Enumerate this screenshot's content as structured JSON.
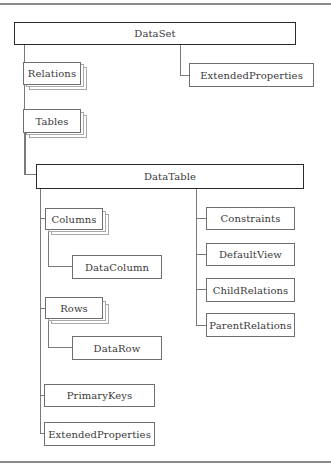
{
  "diagram": {
    "root": {
      "label": "DataSet"
    },
    "dataset_children": {
      "relations": {
        "label": "Relations",
        "collection": true
      },
      "tables": {
        "label": "Tables",
        "collection": true
      },
      "extended_properties": {
        "label": "ExtendedProperties",
        "collection": false
      }
    },
    "datatable": {
      "label": "DataTable"
    },
    "datatable_left": {
      "columns": {
        "label": "Columns",
        "collection": true
      },
      "data_column": {
        "label": "DataColumn"
      },
      "rows": {
        "label": "Rows",
        "collection": true
      },
      "data_row": {
        "label": "DataRow"
      },
      "primary_keys": {
        "label": "PrimaryKeys"
      },
      "extended_properties": {
        "label": "ExtendedProperties"
      }
    },
    "datatable_right": {
      "constraints": {
        "label": "Constraints"
      },
      "default_view": {
        "label": "DefaultView"
      },
      "child_relations": {
        "label": "ChildRelations"
      },
      "parent_relations": {
        "label": "ParentRelations"
      }
    }
  }
}
